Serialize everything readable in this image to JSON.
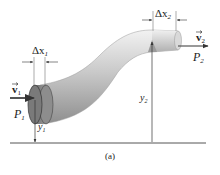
{
  "figure": {
    "caption": "(a)",
    "colors": {
      "pipe_light": "#e6e6e6",
      "pipe_mid": "#b8b8b8",
      "pipe_dark": "#8a8a8a",
      "disk_face": "#7d7d7d",
      "line": "#333333"
    },
    "labels": {
      "delta_x1": {
        "main": "Δx",
        "sub": "1"
      },
      "delta_x2": {
        "main": "Δx",
        "sub": "2"
      },
      "velocity1": {
        "main": "v",
        "sub": "1"
      },
      "velocity2": {
        "main": "v",
        "sub": "2"
      },
      "pressure1": {
        "main": "P",
        "sub": "1"
      },
      "pressure2": {
        "main": "P",
        "sub": "2"
      },
      "height1": {
        "main": "y",
        "sub": "1"
      },
      "height2": {
        "main": "y",
        "sub": "2"
      }
    }
  }
}
